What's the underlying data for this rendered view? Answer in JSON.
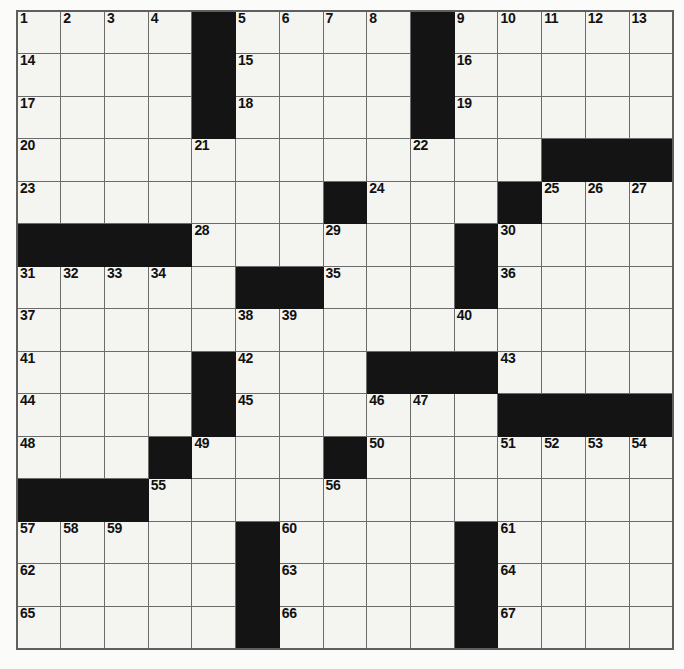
{
  "puzzle": {
    "title": "Crossword Puzzle Grid",
    "rows": 15,
    "cols": 15,
    "colors": {
      "block": "#141414",
      "cell": "#f4f4f1",
      "gridline": "#6b6b6b",
      "number": "#111111",
      "page": "#fbfbf9"
    },
    "numbered_clue_count": 67,
    "black_square_count": 42,
    "grid": [
      [
        {
          "n": "1"
        },
        {
          "n": "2"
        },
        {
          "n": "3"
        },
        {
          "n": "4"
        },
        {
          "b": true
        },
        {
          "n": "5"
        },
        {
          "n": "6"
        },
        {
          "n": "7"
        },
        {
          "n": "8"
        },
        {
          "b": true
        },
        {
          "n": "9"
        },
        {
          "n": "10"
        },
        {
          "n": "11"
        },
        {
          "n": "12"
        },
        {
          "n": "13"
        }
      ],
      [
        {
          "n": "14"
        },
        {},
        {},
        {},
        {
          "b": true
        },
        {
          "n": "15"
        },
        {},
        {},
        {},
        {
          "b": true
        },
        {
          "n": "16"
        },
        {},
        {},
        {},
        {}
      ],
      [
        {
          "n": "17"
        },
        {},
        {},
        {},
        {
          "b": true
        },
        {
          "n": "18"
        },
        {},
        {},
        {},
        {
          "b": true
        },
        {
          "n": "19"
        },
        {},
        {},
        {},
        {}
      ],
      [
        {
          "n": "20"
        },
        {},
        {},
        {},
        {
          "n": "21"
        },
        {},
        {},
        {},
        {},
        {
          "n": "22"
        },
        {},
        {},
        {
          "b": true
        },
        {
          "b": true
        },
        {
          "b": true
        }
      ],
      [
        {
          "n": "23"
        },
        {},
        {},
        {},
        {},
        {},
        {},
        {
          "b": true
        },
        {
          "n": "24"
        },
        {},
        {},
        {
          "b": true
        },
        {
          "n": "25"
        },
        {
          "n": "26"
        },
        {
          "n": "27"
        }
      ],
      [
        {
          "b": true
        },
        {
          "b": true
        },
        {
          "b": true
        },
        {
          "b": true
        },
        {
          "n": "28"
        },
        {},
        {},
        {
          "n": "29"
        },
        {},
        {},
        {
          "b": true
        },
        {
          "n": "30"
        },
        {},
        {},
        {}
      ],
      [
        {
          "n": "31"
        },
        {
          "n": "32"
        },
        {
          "n": "33"
        },
        {
          "n": "34"
        },
        {},
        {
          "b": true
        },
        {
          "b": true
        },
        {
          "n": "35"
        },
        {},
        {},
        {
          "b": true
        },
        {
          "n": "36"
        },
        {},
        {},
        {}
      ],
      [
        {
          "n": "37"
        },
        {},
        {},
        {},
        {},
        {
          "n": "38"
        },
        {
          "n": "39"
        },
        {},
        {},
        {},
        {
          "n": "40"
        },
        {},
        {},
        {},
        {}
      ],
      [
        {
          "n": "41"
        },
        {},
        {},
        {},
        {
          "b": true
        },
        {
          "n": "42"
        },
        {},
        {},
        {
          "b": true
        },
        {
          "b": true
        },
        {
          "b": true
        },
        {
          "n": "43"
        },
        {},
        {},
        {}
      ],
      [
        {
          "n": "44"
        },
        {},
        {},
        {},
        {
          "b": true
        },
        {
          "n": "45"
        },
        {},
        {},
        {
          "n": "46"
        },
        {
          "n": "47"
        },
        {},
        {
          "b": true
        },
        {
          "b": true
        },
        {
          "b": true
        },
        {
          "b": true
        }
      ],
      [
        {
          "n": "48"
        },
        {},
        {},
        {
          "b": true
        },
        {
          "n": "49"
        },
        {},
        {},
        {
          "b": true
        },
        {
          "n": "50"
        },
        {},
        {},
        {
          "n": "51"
        },
        {
          "n": "52"
        },
        {
          "n": "53"
        },
        {
          "n": "54"
        }
      ],
      [
        {
          "b": true
        },
        {
          "b": true
        },
        {
          "b": true
        },
        {
          "n": "55"
        },
        {},
        {},
        {},
        {
          "n": "56"
        },
        {},
        {},
        {},
        {},
        {},
        {},
        {}
      ],
      [
        {
          "n": "57"
        },
        {
          "n": "58"
        },
        {
          "n": "59"
        },
        {},
        {},
        {
          "b": true
        },
        {
          "n": "60"
        },
        {},
        {},
        {},
        {
          "b": true
        },
        {
          "n": "61"
        },
        {},
        {},
        {}
      ],
      [
        {
          "n": "62"
        },
        {},
        {},
        {},
        {},
        {
          "b": true
        },
        {
          "n": "63"
        },
        {},
        {},
        {},
        {
          "b": true
        },
        {
          "n": "64"
        },
        {},
        {},
        {}
      ],
      [
        {
          "n": "65"
        },
        {},
        {},
        {},
        {},
        {
          "b": true
        },
        {
          "n": "66"
        },
        {},
        {},
        {},
        {
          "b": true
        },
        {
          "n": "67"
        },
        {},
        {},
        {}
      ]
    ]
  }
}
